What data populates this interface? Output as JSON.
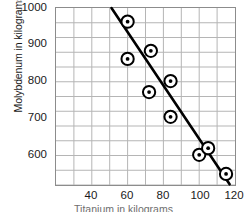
{
  "chart_data": {
    "type": "scatter",
    "title": "",
    "xlabel": "Titanium in kilograms",
    "ylabel": "Molybdenum in kilograms",
    "xlim": [
      20,
      120
    ],
    "ylim": [
      520,
      1000
    ],
    "x_ticks": [
      40,
      60,
      80,
      100,
      120
    ],
    "y_ticks": [
      600,
      700,
      800,
      900,
      1000
    ],
    "x_minor_step": 10,
    "y_minor_step": 40,
    "grid": true,
    "legend": null,
    "series": [
      {
        "name": "observations",
        "marker": "circled-dot",
        "points": [
          {
            "x": 60,
            "y": 963
          },
          {
            "x": 60,
            "y": 862
          },
          {
            "x": 73,
            "y": 884
          },
          {
            "x": 72,
            "y": 772
          },
          {
            "x": 84,
            "y": 802
          },
          {
            "x": 84,
            "y": 705
          },
          {
            "x": 100,
            "y": 602
          },
          {
            "x": 105,
            "y": 620
          },
          {
            "x": 115,
            "y": 550
          }
        ]
      }
    ],
    "trend_line": {
      "name": "line of best fit",
      "color": "#000000",
      "x0": 51,
      "y0": 1000,
      "x1": 117,
      "y1": 522
    }
  },
  "axes": {
    "y_tick_labels": [
      "1000",
      "900",
      "800",
      "700",
      "600"
    ],
    "x_tick_labels": [
      "40",
      "60",
      "80",
      "100",
      "120"
    ],
    "y_axis_title": "Molybdenum in kilograms",
    "x_axis_title": "Titanium in kilograms"
  },
  "colors": {
    "grid": "#b5b5b5",
    "frame": "#8c8c8c",
    "marker_stroke": "#000000",
    "marker_fill": "#ffffff",
    "marker_dot": "#000000",
    "line": "#000000",
    "text": "#1a1a1a"
  }
}
